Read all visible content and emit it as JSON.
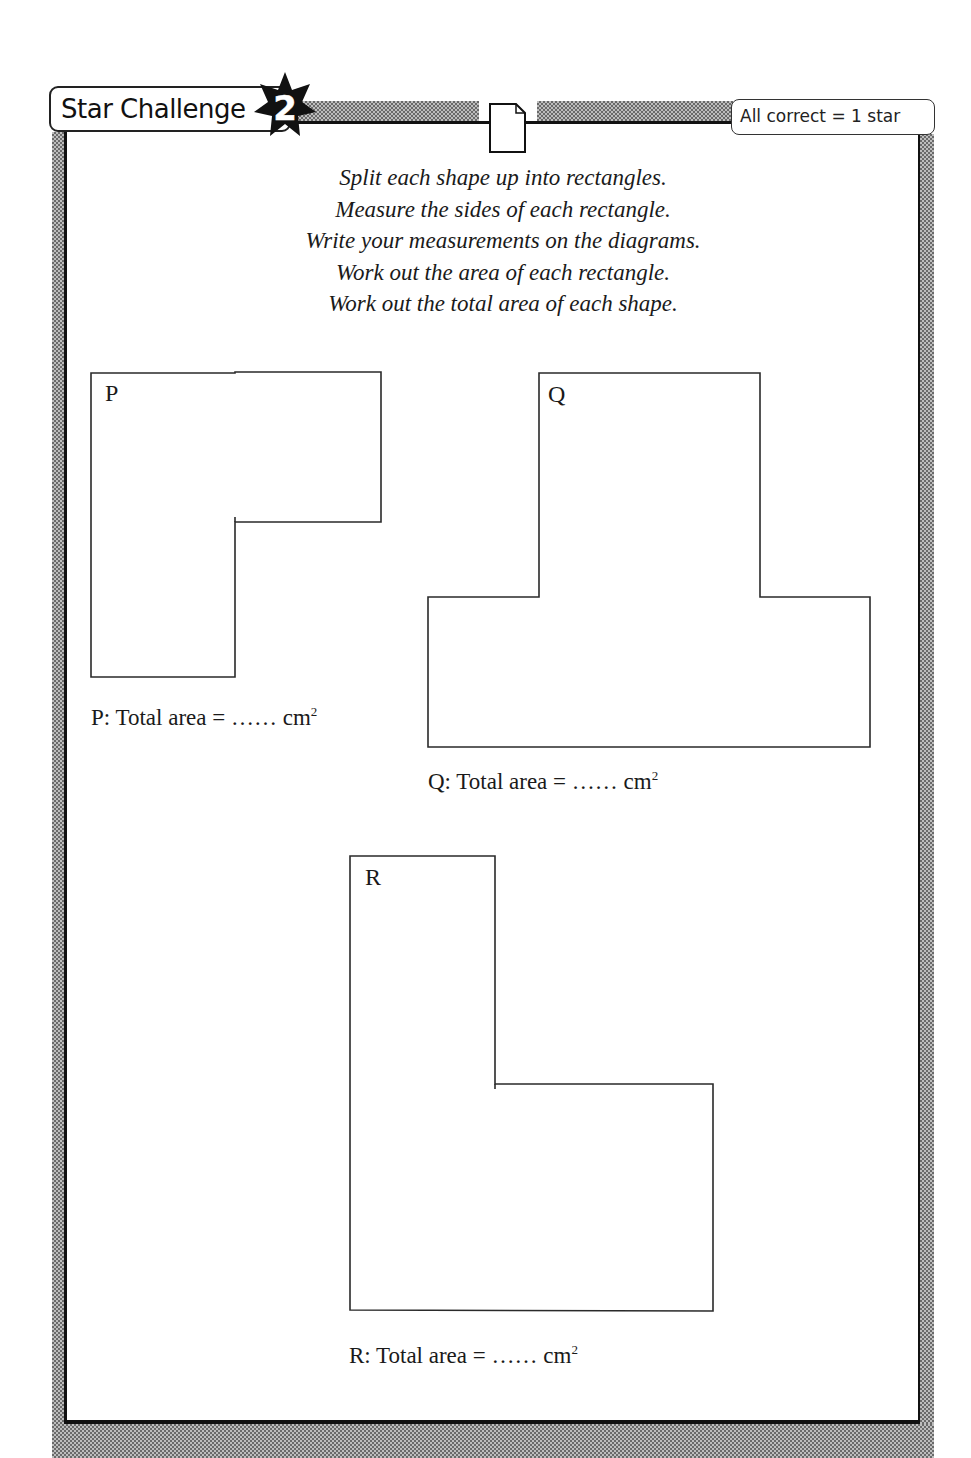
{
  "header": {
    "title": "Star Challenge",
    "challenge_number": "2",
    "scoring": "All correct = 1 star",
    "icons": [
      "star-badge-icon",
      "document-icon"
    ]
  },
  "instructions": [
    "Split each shape up into rectangles.",
    "Measure the sides of each rectangle.",
    "Write your measurements on the diagrams.",
    "Work out the area of each rectangle.",
    "Work out the total area of each shape."
  ],
  "shapes": [
    {
      "label": "P",
      "answer_prefix": "P: Total area = ",
      "answer_blank": "……",
      "answer_unit": "cm",
      "answer_exp": "2"
    },
    {
      "label": "Q",
      "answer_prefix": "Q: Total area = ",
      "answer_blank": "……",
      "answer_unit": "cm",
      "answer_exp": "2"
    },
    {
      "label": "R",
      "answer_prefix": "R: Total area = ",
      "answer_blank": "……",
      "answer_unit": "cm",
      "answer_exp": "2"
    }
  ],
  "colors": {
    "ink": "#1a1a1a",
    "frame_dither": "#6a6a6a",
    "background": "#ffffff"
  }
}
